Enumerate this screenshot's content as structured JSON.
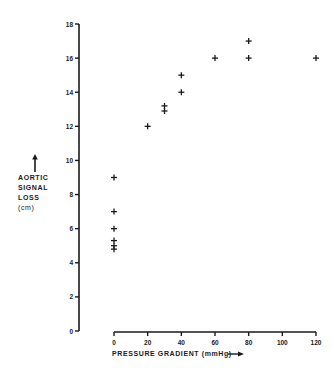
{
  "chart_data": {
    "type": "scatter",
    "title": "",
    "xlabel": "PRESSURE GRADIENT (mmHg)",
    "ylabel": "AORTIC SIGNAL LOSS (cm)",
    "ylabel_lines": [
      "AORTIC",
      "SIGNAL",
      "LOSS",
      "(cm)"
    ],
    "xlim": [
      0,
      120
    ],
    "ylim": [
      0,
      18
    ],
    "xticks": [
      0,
      20,
      40,
      60,
      80,
      100,
      120
    ],
    "yticks": [
      0,
      2,
      4,
      6,
      8,
      10,
      12,
      14,
      16,
      18
    ],
    "grid": false,
    "legend": null,
    "marker": "+",
    "series": [
      {
        "name": "observations",
        "points": [
          {
            "x": 0,
            "y": 9.0
          },
          {
            "x": 0,
            "y": 7.0
          },
          {
            "x": 0,
            "y": 6.0
          },
          {
            "x": 0,
            "y": 5.3
          },
          {
            "x": 0,
            "y": 5.0
          },
          {
            "x": 0,
            "y": 4.8
          },
          {
            "x": 20,
            "y": 12.0
          },
          {
            "x": 30,
            "y": 13.2
          },
          {
            "x": 30,
            "y": 12.9
          },
          {
            "x": 40,
            "y": 15.0
          },
          {
            "x": 40,
            "y": 14.0
          },
          {
            "x": 60,
            "y": 16.0
          },
          {
            "x": 80,
            "y": 17.0
          },
          {
            "x": 80,
            "y": 16.0
          },
          {
            "x": 120,
            "y": 16.0
          }
        ]
      }
    ]
  },
  "colors": {
    "ink": "#1a1a1a",
    "background": "#ffffff"
  }
}
